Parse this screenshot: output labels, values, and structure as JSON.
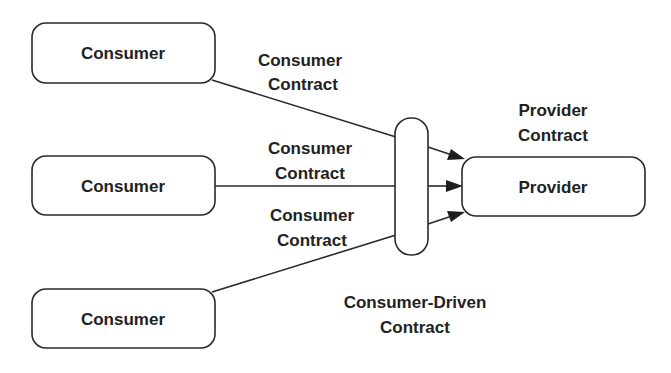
{
  "diagram": {
    "consumers": [
      {
        "label": "Consumer",
        "x": 32,
        "y": 23,
        "w": 183,
        "h": 60
      },
      {
        "label": "Consumer",
        "x": 32,
        "y": 156,
        "w": 183,
        "h": 59
      },
      {
        "label": "Consumer",
        "x": 32,
        "y": 289,
        "w": 183,
        "h": 59
      }
    ],
    "provider": {
      "label": "Provider",
      "x": 462,
      "y": 157,
      "w": 183,
      "h": 59
    },
    "aggregator": {
      "x": 395,
      "y": 118,
      "w": 33,
      "h": 137
    },
    "consumer_contract_labels": [
      {
        "line1": "Consumer",
        "line2": "Contract"
      },
      {
        "line1": "Consumer",
        "line2": "Contract"
      },
      {
        "line1": "Consumer",
        "line2": "Contract"
      }
    ],
    "provider_contract_label": {
      "line1": "Provider",
      "line2": "Contract"
    },
    "consumer_driven_contract_label": {
      "line1": "Consumer-Driven",
      "line2": "Contract"
    },
    "colors": {
      "stroke": "#2a2a2a",
      "text": "#222222",
      "background": "#ffffff"
    }
  }
}
